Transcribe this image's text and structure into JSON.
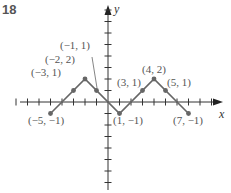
{
  "problem_number": "18",
  "axes": {
    "x_label": "x",
    "y_label": "y",
    "x_range": [
      -8,
      9
    ],
    "y_range": [
      -7,
      8
    ],
    "origin_px": [
      108,
      102
    ],
    "unit_px": 11.5
  },
  "colors": {
    "graph_line": "#666666",
    "axis": "#333333",
    "label": "#555555"
  },
  "graph": {
    "vertices": [
      [
        -5,
        -1
      ],
      [
        -2,
        2
      ],
      [
        1,
        -1
      ],
      [
        4,
        2
      ],
      [
        7,
        -1
      ]
    ],
    "marked_points": [
      {
        "x": -5,
        "y": -1,
        "label": "(−5, −1)"
      },
      {
        "x": -3,
        "y": 1,
        "label": "(−3, 1)"
      },
      {
        "x": -2,
        "y": 2,
        "label": "(−2, 2)"
      },
      {
        "x": -1,
        "y": 1,
        "label": "(−1, 1)"
      },
      {
        "x": 1,
        "y": -1,
        "label": "(1, −1)"
      },
      {
        "x": 3,
        "y": 1,
        "label": "(3, 1)"
      },
      {
        "x": 4,
        "y": 2,
        "label": "(4, 2)"
      },
      {
        "x": 5,
        "y": 1,
        "label": "(5, 1)"
      },
      {
        "x": 7,
        "y": -1,
        "label": "(7, −1)"
      }
    ]
  },
  "labels": {
    "p_m5_m1": "(−5, −1)",
    "p_m3_1": "(−3, 1)",
    "p_m2_2": "(−2, 2)",
    "p_m1_1": "(−1, 1)",
    "p_1_m1": "(1, −1)",
    "p_3_1": "(3, 1)",
    "p_4_2": "(4, 2)",
    "p_5_1": "(5, 1)",
    "p_7_m1": "(7, −1)"
  }
}
